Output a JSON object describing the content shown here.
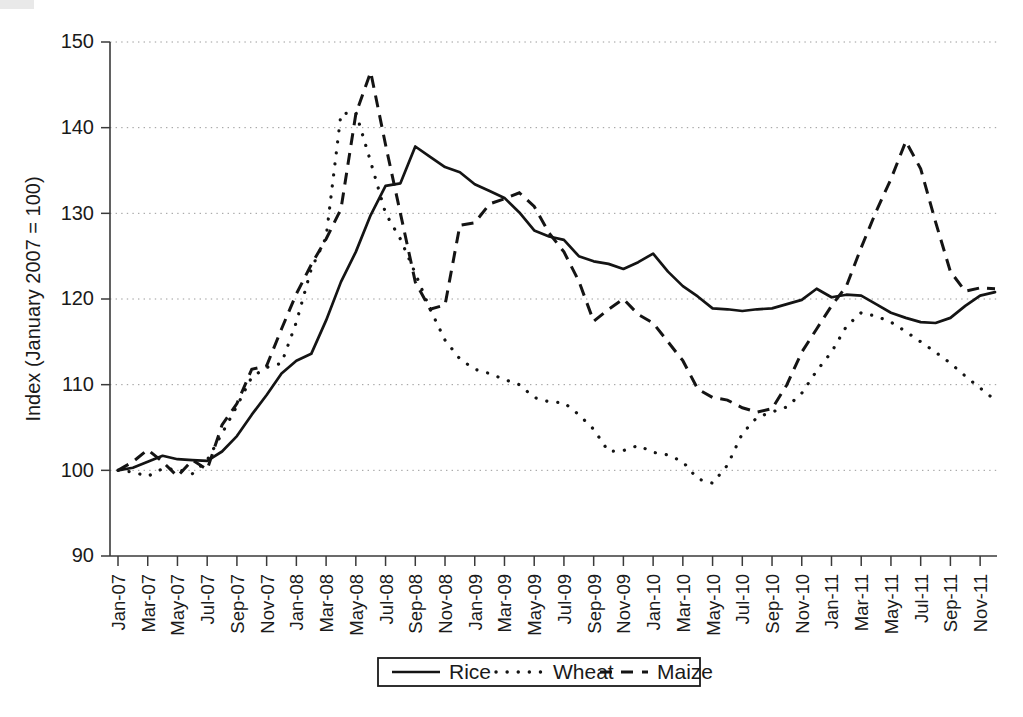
{
  "chart_data": {
    "type": "line",
    "title": "",
    "xlabel": "",
    "ylabel": "Index (January 2007 = 100)",
    "ylim": [
      90,
      150
    ],
    "yticks": [
      90,
      100,
      110,
      120,
      130,
      140,
      150
    ],
    "grid": "horizontal-dotted",
    "legend_position": "bottom-center",
    "x": [
      "Jan-07",
      "Feb-07",
      "Mar-07",
      "Apr-07",
      "May-07",
      "Jun-07",
      "Jul-07",
      "Aug-07",
      "Sep-07",
      "Oct-07",
      "Nov-07",
      "Dec-07",
      "Jan-08",
      "Feb-08",
      "Mar-08",
      "Apr-08",
      "May-08",
      "Jun-08",
      "Jul-08",
      "Aug-08",
      "Sep-08",
      "Oct-08",
      "Nov-08",
      "Dec-08",
      "Jan-09",
      "Feb-09",
      "Mar-09",
      "Apr-09",
      "May-09",
      "Jun-09",
      "Jul-09",
      "Aug-09",
      "Sep-09",
      "Oct-09",
      "Nov-09",
      "Dec-09",
      "Jan-10",
      "Feb-10",
      "Mar-10",
      "Apr-10",
      "May-10",
      "Jun-10",
      "Jul-10",
      "Aug-10",
      "Sep-10",
      "Oct-10",
      "Nov-10",
      "Dec-10",
      "Jan-11",
      "Feb-11",
      "Mar-11",
      "Apr-11",
      "May-11",
      "Jun-11",
      "Jul-11",
      "Aug-11",
      "Sep-11",
      "Oct-11",
      "Nov-11",
      "Dec-11"
    ],
    "xtick_labels": [
      "Jan-07",
      "Mar-07",
      "May-07",
      "Jul-07",
      "Sep-07",
      "Nov-07",
      "Jan-08",
      "Mar-08",
      "May-08",
      "Jul-08",
      "Sep-08",
      "Nov-08",
      "Jan-09",
      "Mar-09",
      "May-09",
      "Jul-09",
      "Sep-09",
      "Nov-09",
      "Jan-10",
      "Mar-10",
      "May-10",
      "Jul-10",
      "Sep-10",
      "Nov-10",
      "Jan-11",
      "Mar-11",
      "May-11",
      "Jul-11",
      "Sep-11",
      "Nov-11"
    ],
    "series": [
      {
        "name": "Rice",
        "style": "solid",
        "values": [
          100.0,
          100.3,
          101.0,
          101.7,
          101.3,
          101.2,
          101.1,
          102.2,
          104.0,
          106.5,
          108.8,
          111.3,
          112.8,
          113.6,
          117.5,
          122.0,
          125.5,
          129.8,
          133.2,
          133.5,
          137.8,
          136.6,
          135.4,
          134.8,
          133.4,
          132.6,
          131.8,
          130.1,
          128.0,
          127.3,
          126.9,
          125.0,
          124.4,
          124.1,
          123.5,
          124.3,
          125.3,
          123.2,
          121.5,
          120.3,
          118.9,
          118.8,
          118.6,
          118.8,
          118.9,
          119.4,
          119.9,
          121.2,
          120.2,
          120.5,
          120.4,
          119.4,
          118.4,
          117.8,
          117.3,
          117.2,
          117.8,
          119.2,
          120.4,
          120.8
        ]
      },
      {
        "name": "Wheat",
        "style": "dotted",
        "values": [
          100.0,
          99.8,
          99.3,
          100.2,
          100.1,
          99.6,
          101.2,
          104.3,
          107.5,
          110.9,
          112.0,
          112.5,
          117.3,
          123.5,
          127.2,
          141.6,
          141.8,
          136.0,
          130.0,
          127.0,
          123.0,
          118.8,
          115.2,
          113.0,
          111.8,
          111.3,
          110.6,
          110.0,
          108.5,
          108.0,
          107.9,
          106.5,
          104.8,
          102.2,
          102.3,
          102.9,
          102.1,
          101.8,
          101.0,
          99.0,
          98.5,
          100.6,
          104.3,
          106.2,
          106.8,
          107.4,
          109.0,
          111.6,
          113.8,
          116.8,
          118.4,
          118.0,
          117.3,
          116.2,
          115.0,
          113.8,
          112.5,
          111.0,
          109.6,
          108.2
        ]
      },
      {
        "name": "Maize",
        "style": "dashed",
        "values": [
          100.0,
          101.0,
          102.4,
          101.0,
          99.3,
          101.2,
          100.1,
          105.3,
          107.8,
          111.8,
          112.2,
          116.5,
          120.6,
          124.0,
          127.0,
          130.5,
          141.6,
          146.5,
          138.0,
          130.0,
          122.0,
          118.8,
          119.3,
          128.6,
          128.9,
          131.1,
          131.7,
          132.4,
          130.8,
          127.7,
          125.5,
          122.1,
          117.4,
          118.8,
          120.0,
          118.2,
          117.2,
          115.0,
          112.8,
          109.5,
          108.5,
          108.2,
          107.3,
          106.8,
          107.2,
          110.0,
          113.8,
          116.5,
          119.2,
          121.5,
          126.0,
          130.2,
          134.0,
          138.4,
          135.2,
          129.0,
          123.2,
          120.9,
          121.3,
          121.2
        ]
      }
    ],
    "legend": [
      {
        "label": "Rice",
        "style": "solid"
      },
      {
        "label": "Wheat",
        "style": "dotted"
      },
      {
        "label": "Maize",
        "style": "dashed"
      }
    ]
  },
  "geometry": {
    "plot_left": 110,
    "plot_right": 997,
    "plot_top": 42,
    "plot_bottom": 556
  }
}
